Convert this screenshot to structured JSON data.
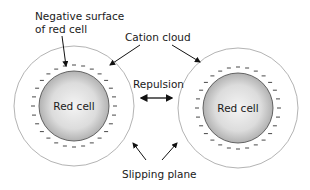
{
  "labels": {
    "negative_surface_line1": "Negative surface",
    "negative_surface_line2": "of red cell",
    "cation_cloud": "Cation cloud",
    "repulsion": "Repulsion",
    "slipping_plane": "Slipping plane",
    "left_cell": "Red cell",
    "right_cell": "Red cell"
  },
  "cells": [
    {
      "name": "left",
      "cx": 74,
      "cy": 106,
      "outer_r": 60,
      "inner_r": 35
    },
    {
      "name": "right",
      "cx": 238,
      "cy": 108,
      "outer_r": 60,
      "inner_r": 35
    }
  ],
  "colors": {
    "outline": "#9a9a9a",
    "cell_fill_light": "#f2f2f2",
    "cell_fill_dark": "#a8a8a8",
    "text": "#1a1a1a"
  }
}
